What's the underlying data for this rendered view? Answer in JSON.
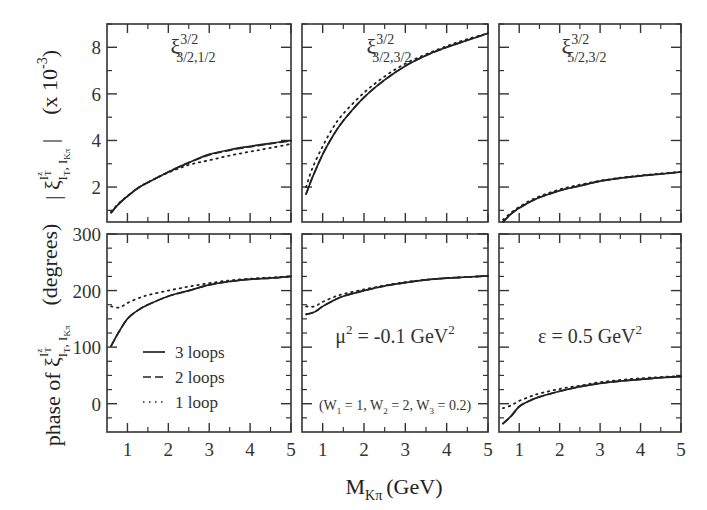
{
  "chart_data": {
    "type": "line",
    "layout": {
      "rows": 2,
      "cols": 3,
      "shared_x": true,
      "grid": false
    },
    "x_axis": {
      "label": "M_Kπ (GeV)",
      "label_main": "M",
      "label_sub": "Kπ",
      "label_unit": "(GeV)",
      "xlim": [
        0.5,
        5
      ],
      "ticks": [
        1,
        2,
        3,
        4,
        5
      ],
      "minor_ticks": [
        1.5,
        2.5,
        3.5,
        4.5
      ]
    },
    "rows": [
      {
        "ylabel": "|ξ^{I_T^z}_{I_T, I_Kπ}| (x 10^-3)",
        "ylabel_parts": {
          "prefix": "| ξ",
          "sup": "I",
          "supsup": "z",
          "supsub": "T",
          "sub": "I",
          "subsub": "T",
          "sub2": ", I",
          "sub2sub": "Kπ",
          "suffix": " |",
          "scale": "(x 10",
          "scale_exp": "-3",
          "scale_close": ")"
        },
        "ylim": [
          0.5,
          9
        ],
        "yticks": [
          2,
          4,
          6,
          8
        ],
        "y_minor_ticks": [
          1,
          3,
          5,
          7,
          9
        ]
      },
      {
        "ylabel": "phase of ξ^{I_T^z}_{I_T, I_Kπ} (degrees)",
        "ylabel_parts": {
          "prefix": "phase of ξ",
          "sup": "I",
          "supsup": "z",
          "supsub": "T",
          "sub": "I",
          "subsub": "T",
          "sub2": ", I",
          "sub2sub": "Kπ",
          "suffix": "(degrees)"
        },
        "ylim": [
          -50,
          300
        ],
        "yticks": [
          0,
          100,
          200,
          300
        ],
        "y_minor_ticks": [
          -25,
          25,
          50,
          75,
          125,
          150,
          175,
          225,
          250,
          275
        ]
      }
    ],
    "panels": [
      {
        "row": 0,
        "col": 0,
        "title": "ξ^{3/2}_{3/2,1/2}",
        "title_parts": {
          "base": "ξ",
          "sup": "3/2",
          "sub": "3/2,1/2"
        },
        "x": [
          0.6,
          0.8,
          1.0,
          1.25,
          1.5,
          2.0,
          2.5,
          3.0,
          3.5,
          4.0,
          4.5,
          5.0
        ],
        "series": [
          {
            "name": "3 loops",
            "style": "solid",
            "values": [
              0.9,
              1.3,
              1.6,
              1.95,
              2.2,
              2.65,
              3.05,
              3.4,
              3.6,
              3.75,
              3.88,
              4.0
            ]
          },
          {
            "name": "2 loops",
            "style": "dashed",
            "values": [
              0.9,
              1.3,
              1.6,
              1.95,
              2.2,
              2.65,
              3.05,
              3.38,
              3.58,
              3.73,
              3.86,
              3.98
            ]
          },
          {
            "name": "1 loop",
            "style": "dotted",
            "values": [
              0.95,
              1.32,
              1.62,
              1.95,
              2.2,
              2.62,
              2.95,
              3.15,
              3.35,
              3.52,
              3.68,
              3.85
            ]
          }
        ]
      },
      {
        "row": 0,
        "col": 1,
        "title": "ξ^{3/2}_{3/2,3/2}",
        "title_parts": {
          "base": "ξ",
          "sup": "3/2",
          "sub": "3/2,3/2"
        },
        "x": [
          0.6,
          0.75,
          1.0,
          1.25,
          1.5,
          2.0,
          2.5,
          3.0,
          3.5,
          4.0,
          4.5,
          5.0
        ],
        "series": [
          {
            "name": "3 loops",
            "style": "solid",
            "values": [
              1.7,
              2.4,
              3.4,
              4.2,
              4.85,
              5.85,
              6.6,
              7.2,
              7.65,
              8.0,
              8.3,
              8.6
            ]
          },
          {
            "name": "2 loops",
            "style": "dashed",
            "values": [
              1.7,
              2.4,
              3.4,
              4.2,
              4.85,
              5.85,
              6.6,
              7.2,
              7.65,
              8.0,
              8.3,
              8.6
            ]
          },
          {
            "name": "1 loop",
            "style": "dotted",
            "values": [
              2.0,
              2.8,
              3.75,
              4.55,
              5.15,
              6.05,
              6.75,
              7.3,
              7.7,
              8.05,
              8.35,
              8.6
            ]
          }
        ]
      },
      {
        "row": 0,
        "col": 2,
        "title": "ξ^{3/2}_{5/2,3/2}",
        "title_parts": {
          "base": "ξ",
          "sup": "3/2",
          "sub": "5/2,3/2"
        },
        "x": [
          0.6,
          0.8,
          1.0,
          1.25,
          1.5,
          2.0,
          2.5,
          3.0,
          3.5,
          4.0,
          4.5,
          5.0
        ],
        "series": [
          {
            "name": "3 loops",
            "style": "solid",
            "values": [
              0.5,
              0.85,
              1.1,
              1.35,
              1.55,
              1.85,
              2.05,
              2.25,
              2.38,
              2.48,
              2.56,
              2.65
            ]
          },
          {
            "name": "2 loops",
            "style": "dashed",
            "values": [
              0.5,
              0.85,
              1.1,
              1.35,
              1.55,
              1.85,
              2.05,
              2.25,
              2.38,
              2.48,
              2.56,
              2.65
            ]
          },
          {
            "name": "1 loop",
            "style": "dotted",
            "values": [
              0.6,
              0.9,
              1.15,
              1.4,
              1.6,
              1.9,
              2.1,
              2.27,
              2.4,
              2.5,
              2.58,
              2.65
            ]
          }
        ]
      },
      {
        "row": 1,
        "col": 0,
        "annotation": "",
        "x": [
          0.6,
          0.8,
          1.0,
          1.25,
          1.5,
          2.0,
          2.5,
          3.0,
          3.5,
          4.0,
          4.5,
          5.0
        ],
        "series": [
          {
            "name": "3 loops",
            "style": "solid",
            "values": [
              102,
              128,
              150,
              165,
              175,
              190,
              200,
              210,
              216,
              220,
              222,
              225
            ]
          },
          {
            "name": "2 loops",
            "style": "dashed",
            "values": [
              102,
              128,
              150,
              165,
              175,
              190,
              200,
              210,
              216,
              220,
              222,
              225
            ]
          },
          {
            "name": "1 loop",
            "style": "dotted",
            "values": [
              172,
              170,
              178,
              186,
              192,
              200,
              207,
              213,
              218,
              221,
              223,
              225
            ]
          }
        ]
      },
      {
        "row": 1,
        "col": 1,
        "annotation": "μ² = -0.1 GeV²",
        "annotation_parts": {
          "a": "μ",
          "sup1": "2",
          "b": " = -0.1 GeV",
          "sup2": "2"
        },
        "annotation2": "(W₁ = 1, W₂ = 2, W₃ = 0.2)",
        "annotation2_parts": {
          "a": "(W",
          "s1": "1",
          "b": " = 1, W",
          "s2": "2",
          "c": " = 2, W",
          "s3": "3",
          "d": " = 0.2)"
        },
        "x": [
          0.6,
          0.8,
          1.0,
          1.25,
          1.5,
          2.0,
          2.5,
          3.0,
          3.5,
          4.0,
          4.5,
          5.0
        ],
        "series": [
          {
            "name": "3 loops",
            "style": "solid",
            "values": [
              158,
              162,
              172,
              182,
              190,
              200,
              208,
              214,
              219,
              222,
              224,
              226
            ]
          },
          {
            "name": "2 loops",
            "style": "dashed",
            "values": [
              158,
              162,
              172,
              182,
              190,
              200,
              208,
              214,
              219,
              222,
              224,
              226
            ]
          },
          {
            "name": "1 loop",
            "style": "dotted",
            "values": [
              172,
              172,
              180,
              188,
              194,
              202,
              209,
              215,
              219,
              222,
              224,
              226
            ]
          }
        ]
      },
      {
        "row": 1,
        "col": 2,
        "annotation": "ε = 0.5 GeV²",
        "annotation_parts": {
          "a": "ε = 0.5 GeV",
          "sup1": "2"
        },
        "x": [
          0.6,
          0.8,
          1.0,
          1.25,
          1.5,
          2.0,
          2.5,
          3.0,
          3.5,
          4.0,
          4.5,
          5.0
        ],
        "series": [
          {
            "name": "3 loops",
            "style": "solid",
            "values": [
              -35,
              -22,
              -5,
              5,
              12,
              22,
              30,
              36,
              40,
              43,
              46,
              48
            ]
          },
          {
            "name": "2 loops",
            "style": "dashed",
            "values": [
              -35,
              -22,
              -5,
              5,
              12,
              22,
              30,
              36,
              40,
              43,
              46,
              48
            ]
          },
          {
            "name": "1 loop",
            "style": "dotted",
            "values": [
              -8,
              -3,
              5,
              12,
              18,
              26,
              32,
              38,
              42,
              45,
              47,
              49
            ]
          }
        ]
      }
    ],
    "legend": {
      "panel": "row1-col0",
      "position": "lower-left",
      "entries": [
        {
          "label": "3 loops",
          "style": "solid"
        },
        {
          "label": "2 loops",
          "style": "dashed"
        },
        {
          "label": "1 loop",
          "style": "dotted"
        }
      ]
    },
    "colors": {
      "line": "#222222",
      "frame": "#333333",
      "background": "#ffffff"
    }
  }
}
